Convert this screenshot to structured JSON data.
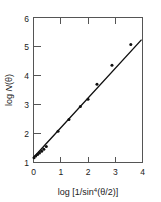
{
  "figure": {
    "background_color": "#ffffff",
    "foreground_color": "#1a1a1a",
    "width": 161,
    "height": 202
  },
  "chart_data": {
    "type": "scatter",
    "title": "",
    "subtitle": "",
    "xlabel": "log [1/sin⁴(θ/2)]",
    "xlabel_parts": {
      "prefix": "log [1/sin",
      "exponent": "4",
      "suffix": "(θ/2)]"
    },
    "ylabel": "log N(θ)",
    "ylabel_parts": {
      "prefix": "log ",
      "symbol": "N",
      "suffix": "(θ)"
    },
    "xlim": [
      0,
      4
    ],
    "ylim": [
      1,
      6
    ],
    "xticks": [
      0,
      1,
      2,
      3,
      4
    ],
    "xtick_labels": [
      "0",
      "1",
      "2",
      "3",
      "4"
    ],
    "yticks": [
      1,
      2,
      3,
      4,
      5,
      6
    ],
    "ytick_labels": [
      "1",
      "2",
      "3",
      "4",
      "5",
      "6"
    ],
    "grid": false,
    "legend": null,
    "tick_direction": "in",
    "frame": "box",
    "marker": {
      "shape": "circle",
      "color": "#111111",
      "size_px": 3.0
    },
    "points": [
      {
        "x": 0.02,
        "y": 1.16
      },
      {
        "x": 0.08,
        "y": 1.22
      },
      {
        "x": 0.15,
        "y": 1.28
      },
      {
        "x": 0.22,
        "y": 1.33
      },
      {
        "x": 0.3,
        "y": 1.39
      },
      {
        "x": 0.38,
        "y": 1.46
      },
      {
        "x": 0.47,
        "y": 1.55
      },
      {
        "x": 0.9,
        "y": 2.08
      },
      {
        "x": 1.3,
        "y": 2.48
      },
      {
        "x": 1.72,
        "y": 2.93
      },
      {
        "x": 2.0,
        "y": 3.18
      },
      {
        "x": 2.33,
        "y": 3.7
      },
      {
        "x": 2.88,
        "y": 4.35
      },
      {
        "x": 3.57,
        "y": 5.07
      }
    ],
    "fit_line": {
      "type": "linear",
      "x_start": 0.0,
      "y_start": 1.17,
      "x_end": 3.95,
      "y_end": 5.22,
      "slope": 1.025,
      "intercept": 1.17,
      "color": "#111111",
      "width_px": 1.4
    }
  }
}
